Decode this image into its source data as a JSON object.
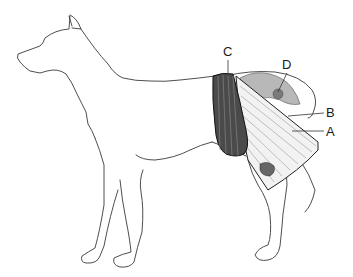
{
  "figure": {
    "colors": {
      "outline": "#3a3a3a",
      "c_fill": "#4a4a4a",
      "a_fill": "#f0f0f0",
      "organ_fill": "#b8b8b8",
      "dark_band": "#111111"
    }
  },
  "labels": [
    {
      "id": "C",
      "text": "C"
    },
    {
      "id": "D",
      "text": "D"
    },
    {
      "id": "B",
      "text": "B"
    },
    {
      "id": "A",
      "text": "A"
    }
  ]
}
